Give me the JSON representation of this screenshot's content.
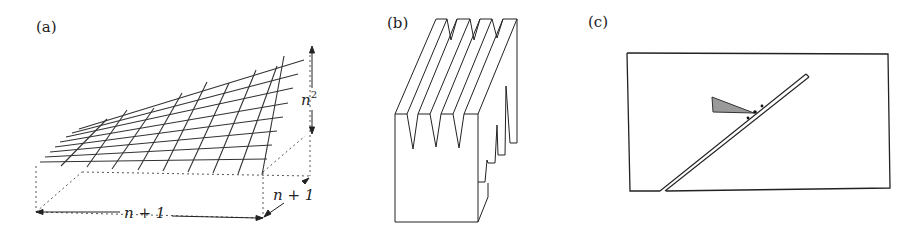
{
  "figure": {
    "panels": [
      {
        "id": "a",
        "label": "(a)",
        "description": "Perspective grid surface over a dotted box with dimension arrows",
        "annotations": {
          "height": "n",
          "height_exp": "2",
          "width": "n + 1",
          "depth": "n + 1"
        }
      },
      {
        "id": "b",
        "label": "(b)",
        "description": "3D block with V-shaped grooves cut into the top face"
      },
      {
        "id": "c",
        "label": "(c)",
        "description": "Rectangle with a diagonal double-line ramp and a gray wedge touching it"
      }
    ]
  },
  "colors": {
    "stroke": "#222222",
    "wedge_fill": "#9a9a9a",
    "background": "#ffffff"
  }
}
